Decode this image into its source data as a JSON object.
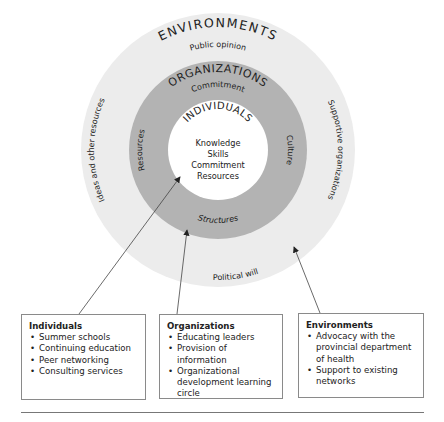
{
  "diagram": {
    "colors": {
      "outer_ring": "#ececec",
      "middle_ring": "#b3b3b3",
      "inner_circle": "#ffffff",
      "text": "#222222",
      "arrow": "#444444",
      "box_border": "#8a8a8a"
    },
    "environments": {
      "title": "ENVIRONMENTS",
      "top": "Public opinion",
      "left": "Ideas and other resources",
      "right": "Supportive organizations",
      "bottom": "Political will"
    },
    "organizations": {
      "title": "ORGANIZATIONS",
      "top": "Commitment",
      "left": "Resources",
      "right": "Culture",
      "bottom": "Structures"
    },
    "individuals": {
      "title": "INDIVIDUALS",
      "items": [
        "Knowledge",
        "Skills",
        "Commitment",
        "Resources"
      ]
    }
  },
  "boxes": [
    {
      "title": "Individuals",
      "items": [
        "Summer schools",
        "Continuing education",
        "Peer networking",
        "Consulting services"
      ]
    },
    {
      "title": "Organizations",
      "items": [
        "Educating leaders",
        "Provision of information",
        "Organizational development learning circle"
      ]
    },
    {
      "title": "Environments",
      "items": [
        "Advocacy with the provincial department of health",
        "Support to existing networks"
      ]
    }
  ]
}
